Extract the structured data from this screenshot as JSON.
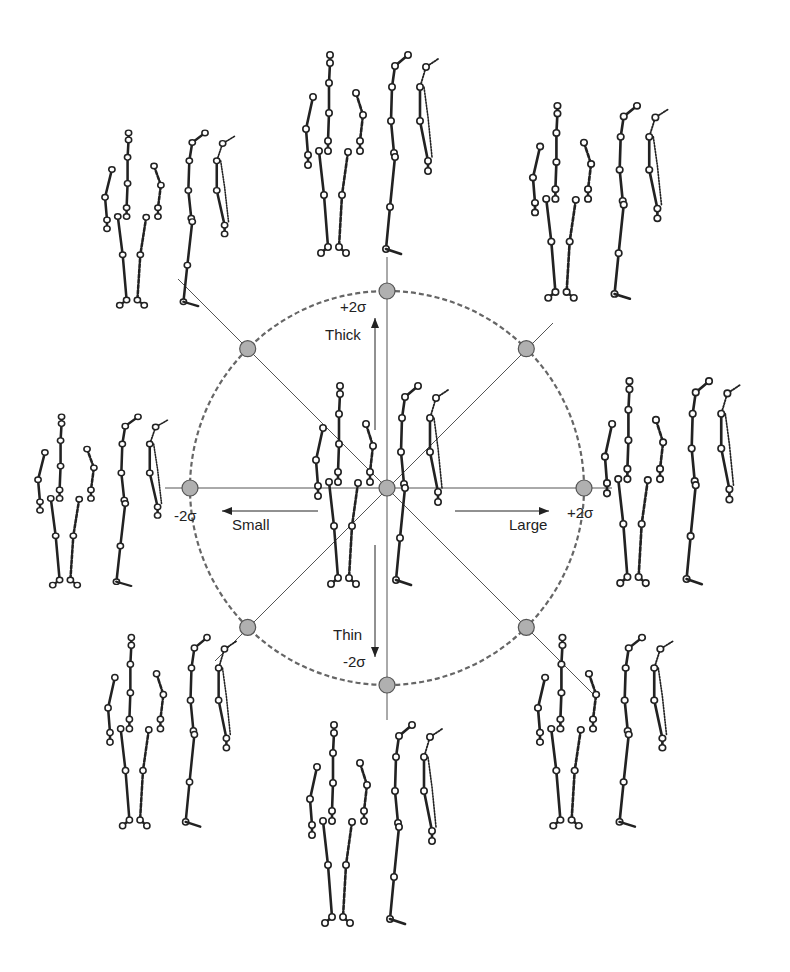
{
  "diagram": {
    "type": "pca-shape-space-walking-figures",
    "center": [
      387,
      488
    ],
    "radius": 197,
    "colors": {
      "ink": "#222222",
      "axis": "#555555",
      "node_fill": "#b0b0b0",
      "node_stroke": "#555555",
      "circle": "#666666",
      "background": "#ffffff"
    },
    "axes": {
      "horizontal": {
        "negative_label": "Small",
        "positive_label": "Large",
        "neg_sigma": "-2σ",
        "pos_sigma": "+2σ"
      },
      "vertical": {
        "positive_label": "Thick",
        "negative_label": "Thin",
        "pos_sigma": "+2σ",
        "neg_sigma": "-2σ"
      }
    },
    "labels": {
      "thick_sigma": "+2σ",
      "thick": "Thick",
      "thin": "Thin",
      "thin_sigma": "-2σ",
      "small_sigma": "-2σ",
      "small": "Small",
      "large": "Large",
      "large_sigma": "+2σ"
    },
    "figure_groups": [
      {
        "id": "center",
        "x": 318,
        "y": 378,
        "sx": 1.0,
        "sy": 1.0
      },
      {
        "id": "top",
        "x": 308,
        "y": 47,
        "sx": 1.0,
        "sy": 1.0
      },
      {
        "id": "bottom",
        "x": 312,
        "y": 717,
        "sx": 1.0,
        "sy": 1.0
      },
      {
        "id": "left",
        "x": 40,
        "y": 410,
        "sx": 0.98,
        "sy": 0.85
      },
      {
        "id": "right",
        "x": 607,
        "y": 373,
        "sx": 1.02,
        "sy": 1.02
      },
      {
        "id": "top-left",
        "x": 107,
        "y": 126,
        "sx": 0.98,
        "sy": 0.87
      },
      {
        "id": "top-right",
        "x": 535,
        "y": 98,
        "sx": 1.02,
        "sy": 0.97
      },
      {
        "id": "bottom-left",
        "x": 110,
        "y": 630,
        "sx": 0.97,
        "sy": 0.95
      },
      {
        "id": "bottom-right",
        "x": 540,
        "y": 630,
        "sx": 1.02,
        "sy": 0.95
      }
    ]
  }
}
